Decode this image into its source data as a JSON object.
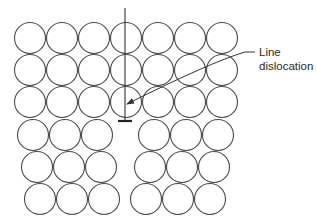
{
  "diagram": {
    "atom_radius": 15.5,
    "rows": [
      {
        "y": 38,
        "xs": [
          30,
          62,
          94,
          126,
          158,
          190,
          222
        ]
      },
      {
        "y": 70,
        "xs": [
          30,
          62,
          94,
          126,
          158,
          190,
          222
        ]
      },
      {
        "y": 102,
        "xs": [
          30,
          62,
          94,
          126,
          158,
          190,
          222
        ]
      },
      {
        "y": 135,
        "xs": [
          33,
          65,
          97,
          154,
          186,
          218
        ]
      },
      {
        "y": 167,
        "xs": [
          37,
          69,
          101,
          150,
          182,
          214
        ]
      },
      {
        "y": 199,
        "xs": [
          40,
          72,
          104,
          146,
          178,
          210
        ]
      }
    ],
    "dislocation": {
      "line_x": 125,
      "line_top": 8,
      "line_bottom": 121,
      "bar_x1": 118,
      "bar_x2": 132,
      "bar_y": 121
    },
    "callout": {
      "label_line1": "Line",
      "label_line2": "dislocation",
      "arrow_tip": [
        127,
        104
      ],
      "leader_start": [
        255,
        52
      ]
    },
    "colors": {
      "atom_stroke": "#4a4a4a",
      "line": "#333333",
      "background": "#ffffff"
    }
  }
}
